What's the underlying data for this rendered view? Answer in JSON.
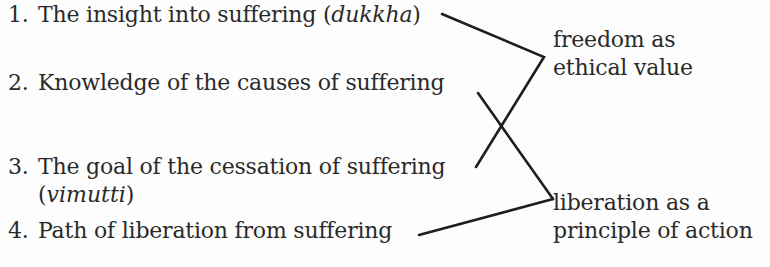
{
  "items": [
    {
      "number": "1.",
      "text": "The insight into suffering (",
      "italic": "dukkha",
      "tail": ")"
    },
    {
      "number": "2.",
      "text": "Knowledge of the causes of suffering"
    },
    {
      "number": "3.",
      "text": "The goal of the cessation of suffering",
      "cont_pre": "(",
      "italic": "vimutti",
      "cont_post": ")"
    },
    {
      "number": "4.",
      "text": "Path of liberation from suffering"
    }
  ],
  "labels": {
    "top": {
      "line1": "freedom as",
      "line2": "ethical value"
    },
    "bottom": {
      "line1": "liberation as a",
      "line2": "principle of action"
    }
  },
  "colors": {
    "line": "#1e1e1e",
    "text": "#2a2a2a",
    "background": "#fdfdfd"
  }
}
